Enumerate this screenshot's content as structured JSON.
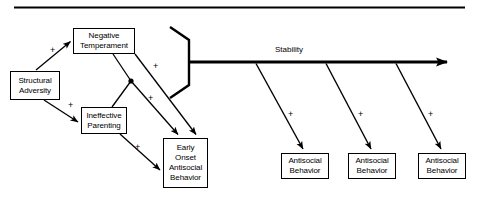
{
  "figure": {
    "top_rule": {
      "visible": true
    },
    "nodes": [
      {
        "id": "structural-adversity",
        "lines": [
          "Structural",
          "Adversity"
        ],
        "x": 10,
        "y": 71,
        "w": 50,
        "h": 29
      },
      {
        "id": "negative-temperament",
        "lines": [
          "Negative",
          "Temperament"
        ],
        "x": 73,
        "y": 28,
        "w": 62,
        "h": 26
      },
      {
        "id": "ineffective-parenting",
        "lines": [
          "Ineffective",
          "Parenting"
        ],
        "x": 81,
        "y": 107,
        "w": 46,
        "h": 27
      },
      {
        "id": "early-onset-antisocial-behavior",
        "lines": [
          "Early",
          "Onset",
          "Antisocial",
          "Behavior"
        ],
        "x": 163,
        "y": 138,
        "w": 45,
        "h": 50
      },
      {
        "id": "antisocial-behavior-1",
        "lines": [
          "Antisocial",
          "Behavior"
        ],
        "x": 281,
        "y": 153,
        "w": 48,
        "h": 26
      },
      {
        "id": "antisocial-behavior-2",
        "lines": [
          "Antisocial",
          "Behavior"
        ],
        "x": 348,
        "y": 153,
        "w": 48,
        "h": 26
      },
      {
        "id": "antisocial-behavior-3",
        "lines": [
          "Antisocial",
          "Behavior"
        ],
        "x": 418,
        "y": 153,
        "w": 48,
        "h": 26
      }
    ],
    "edge_labels": [
      {
        "id": "stability-label",
        "text": "Stability",
        "x": 275,
        "y": 45
      }
    ],
    "plus_signs": [
      {
        "id": "plus-adversity-to-temperament",
        "text": "+",
        "x": 50,
        "y": 46
      },
      {
        "id": "plus-adversity-to-parenting",
        "text": "+",
        "x": 68,
        "y": 101
      },
      {
        "id": "plus-temperament-to-early-onset",
        "text": "+",
        "x": 153,
        "y": 62
      },
      {
        "id": "plus-junction-to-early-onset",
        "text": "+",
        "x": 148,
        "y": 94
      },
      {
        "id": "plus-parenting-to-early-onset",
        "text": "+",
        "x": 135,
        "y": 143
      },
      {
        "id": "plus-stability-to-antisocial-1",
        "text": "+",
        "x": 288,
        "y": 110
      },
      {
        "id": "plus-stability-to-antisocial-2",
        "text": "+",
        "x": 358,
        "y": 110
      },
      {
        "id": "plus-stability-to-antisocial-3",
        "text": "+",
        "x": 428,
        "y": 110
      }
    ],
    "colors": {
      "stroke": "#000000",
      "background": "#ffffff"
    }
  }
}
